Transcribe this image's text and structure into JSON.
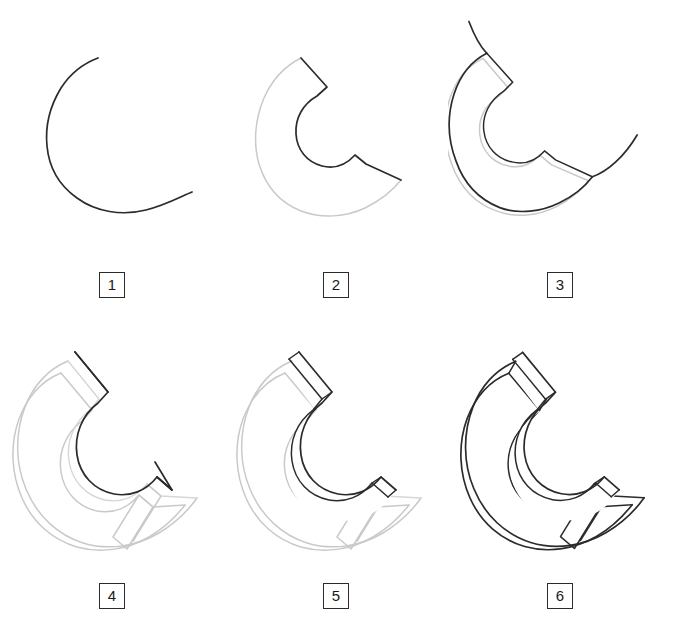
{
  "figure": {
    "kind": "step-by-step-construction-drawing",
    "background_color": "#ffffff",
    "line_color_active": "#2b2b2b",
    "line_color_previous": "#c9c9c9",
    "columns": 3,
    "rows": 2,
    "total_steps": 6
  },
  "steps": [
    {
      "number": "1",
      "label": "1",
      "description": "open C-shaped guide curve",
      "new_stroke_color": "#2b2b2b",
      "prior_stroke_color": "#c9c9c9"
    },
    {
      "number": "2",
      "label": "2",
      "description": "inner C outline closed with flat end faces, outer C in light gray",
      "new_stroke_color": "#2b2b2b",
      "prior_stroke_color": "#c9c9c9"
    },
    {
      "number": "3",
      "label": "3",
      "description": "second offset C contour plus tangent tail arcs",
      "new_stroke_color": "#2b2b2b",
      "prior_stroke_color": "#c9c9c9"
    },
    {
      "number": "4",
      "label": "4",
      "description": "raised top-face C outline offset up-right above base volume",
      "new_stroke_color": "#2b2b2b",
      "prior_stroke_color": "#c9c9c9"
    },
    {
      "number": "5",
      "label": "5",
      "description": "inner ribbon given thickness, end faces drawn",
      "new_stroke_color": "#2b2b2b",
      "prior_stroke_color": "#c9c9c9"
    },
    {
      "number": "6",
      "label": "6",
      "description": "completed solid, all construction lines inked dark",
      "new_stroke_color": "#2b2b2b",
      "prior_stroke_color": "#2b2b2b"
    }
  ]
}
